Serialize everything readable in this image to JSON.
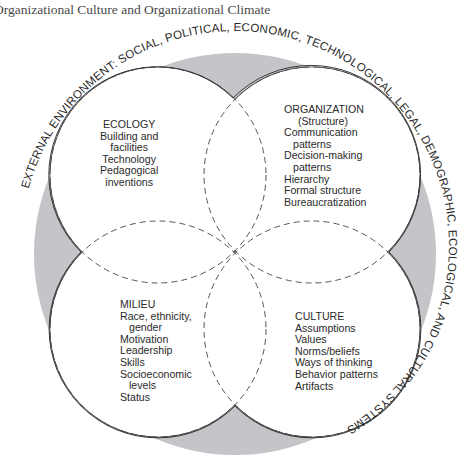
{
  "header": {
    "title": "Organizational Culture and Organizational Climate"
  },
  "diagram": {
    "outer_ring_label": "EXTERNAL ENVIRONMENT: SOCIAL, POLITICAL, ECONOMIC, TECHNOLOGICAL, LEGAL, DEMOGRAPHIC, ECOLOGICAL, AND CULTURAL SYSTEMS",
    "colors": {
      "ring_fill": "#c3c5c8",
      "circle_fill": "#ffffff",
      "stroke": "#3a3a3a",
      "dash": "#555555"
    },
    "quadrants": {
      "ecology": {
        "title": "ECOLOGY",
        "items": [
          "Building and",
          "facilities",
          "Technology",
          "Pedagogical",
          "inventions"
        ]
      },
      "organization": {
        "title": "ORGANIZATION",
        "items": [
          "(Structure)",
          "Communication",
          "patterns",
          "Decision-making",
          "patterns",
          "Hierarchy",
          "Formal structure",
          "Bureaucratization"
        ]
      },
      "milieu": {
        "title": "MILIEU",
        "items": [
          "Race, ethnicity,",
          "gender",
          "Motivation",
          "Leadership",
          "Skills",
          "Socioeconomic",
          "levels",
          "Status"
        ]
      },
      "culture": {
        "title": "CULTURE",
        "items": [
          "Assumptions",
          "Values",
          "Norms/beliefs",
          "Ways of thinking",
          "Behavior patterns",
          "Artifacts"
        ]
      }
    }
  }
}
